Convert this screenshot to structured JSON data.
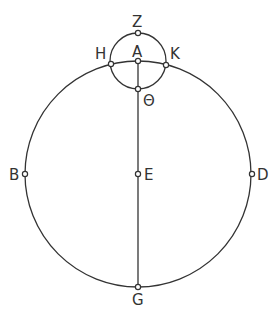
{
  "diagram": {
    "stroke_color": "#333333",
    "background": "#ffffff",
    "big_circle": {
      "cx": 138,
      "cy": 174,
      "r": 113
    },
    "small_circle": {
      "cx": 138,
      "cy": 61,
      "r": 28
    },
    "points": {
      "Z": {
        "label": "Z",
        "x": 138,
        "y": 33
      },
      "A": {
        "label": "A",
        "x": 138,
        "y": 61
      },
      "H": {
        "label": "H",
        "x": 111,
        "y": 64
      },
      "K": {
        "label": "K",
        "x": 166,
        "y": 65
      },
      "Theta": {
        "label": "Θ",
        "x": 138,
        "y": 89
      },
      "B": {
        "label": "B",
        "x": 25,
        "y": 174
      },
      "E": {
        "label": "E",
        "x": 138,
        "y": 174
      },
      "D": {
        "label": "D",
        "x": 252,
        "y": 174
      },
      "G": {
        "label": "G",
        "x": 138,
        "y": 287
      }
    }
  }
}
